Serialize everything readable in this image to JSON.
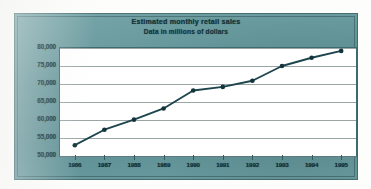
{
  "chart_data": {
    "type": "line",
    "title": "Estimated monthly retail sales",
    "subtitle": "Data in millions of dollars",
    "xlabel": "",
    "ylabel": "",
    "categories": [
      "1986",
      "1987",
      "1988",
      "1989",
      "1990",
      "1991",
      "1992",
      "1993",
      "1994",
      "1995"
    ],
    "values": [
      53000,
      57300,
      60100,
      63200,
      68200,
      69200,
      70900,
      75000,
      77300,
      79200
    ],
    "series": [
      {
        "name": "Estimated monthly retail sales",
        "values": [
          53000,
          57300,
          60100,
          63200,
          68200,
          69200,
          70900,
          75000,
          77300,
          79200
        ]
      }
    ],
    "ylim": [
      50000,
      80000
    ],
    "ytick_labels": [
      "80,000",
      "75,000",
      "70,000",
      "65,000",
      "60,000",
      "55,000",
      "50,000"
    ],
    "ytick_values": [
      80000,
      75000,
      70000,
      65000,
      60000,
      55000,
      50000
    ],
    "grid": true,
    "legend": "none",
    "marker": "circle",
    "units": "millions of dollars"
  },
  "style": {
    "panel_color": "#5d9094",
    "plot_background": "#ffffff",
    "line_color": "#1d454d",
    "marker_color": "#14343c",
    "gridline_color": "#9aa5a6",
    "text_color": "#103036"
  }
}
